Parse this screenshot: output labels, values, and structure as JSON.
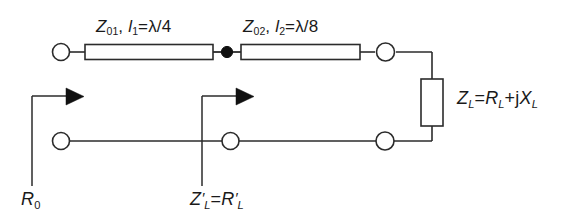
{
  "diagram": {
    "type": "circuit-schematic",
    "background_color": "#ffffff",
    "line_color": "#2b2b2b",
    "text_color": "#1a1a1a",
    "node_fill": "#ffffff"
  },
  "labels": {
    "line1": {
      "impedance_symbol": "Z",
      "impedance_subscript": "01",
      "separator": ", ",
      "length_symbol": "l",
      "length_subscript": "1",
      "equals": "=",
      "length_value": "λ/4",
      "full_text": "Z01, l1=λ/4"
    },
    "line2": {
      "impedance_symbol": "Z",
      "impedance_subscript": "02",
      "separator": ", ",
      "length_symbol": "l",
      "length_subscript": "2",
      "equals": "=",
      "length_value": "λ/8",
      "full_text": "Z02, l2=λ/8"
    },
    "load": {
      "symbol": "Z",
      "subscript": "L",
      "equals": "=",
      "real_symbol": "R",
      "real_subscript": "L",
      "plus": "+j",
      "imag_symbol": "X",
      "imag_subscript": "L",
      "full_text": "ZL=RL+jXL"
    },
    "source_reference": {
      "symbol": "R",
      "subscript": "0",
      "full_text": "R0"
    },
    "intermediate_reference": {
      "symbol": "Z",
      "prime": "′",
      "subscript": "L",
      "equals": "=",
      "right_symbol": "R",
      "right_prime": "′",
      "right_subscript": "L",
      "full_text": "Z′L=R′L"
    }
  },
  "components": {
    "terminal_top_left": "open-terminal-node",
    "transmission_line_1": "transmission-line-section",
    "junction_dot": "filled-junction-node",
    "transmission_line_2": "transmission-line-section",
    "terminal_top_right": "open-terminal-node",
    "load_resistor": "load-impedance-box",
    "terminal_bottom_left": "open-terminal-node",
    "terminal_bottom_middle": "open-terminal-node",
    "terminal_bottom_right": "open-terminal-node",
    "arrow_source": "reference-plane-arrow",
    "arrow_intermediate": "reference-plane-arrow"
  }
}
